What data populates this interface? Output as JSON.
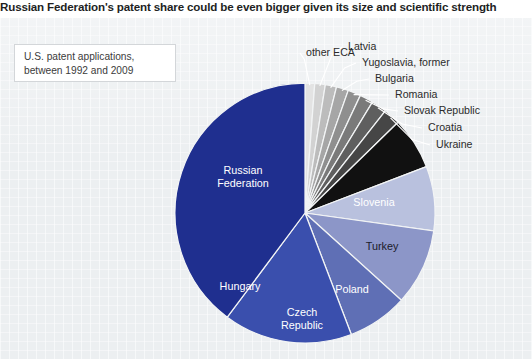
{
  "headline": "Russian Federation's patent share could be even bigger given its size and scientific strength",
  "caption": {
    "line1": "U.S. patent applications,",
    "line2": "between 1992 and 2009"
  },
  "colors": {
    "panel_background": "#eceff1",
    "headline_text": "#221f1f",
    "caption_border": "#d3d6d9",
    "wedge_stroke": "#f2f4f5"
  },
  "chart_data": {
    "type": "pie",
    "title": "Russian Federation's patent share could be even bigger given its size and scientific strength",
    "subtitle": "U.S. patent applications, between 1992 and 2009",
    "legend_position": "labels-on-slices",
    "grid": false,
    "value_unit": "percent share of U.S. patent applications",
    "start_angle_deg": 0,
    "direction": "clockwise",
    "categories": [
      "other ECA",
      "Latvia",
      "Yugoslavia, former",
      "Bulgaria",
      "Romania",
      "Slovak Republic",
      "Croatia",
      "Ukraine",
      "Slovenia",
      "Turkey",
      "Poland",
      "Czech Republic",
      "Hungary",
      "Russian Federation"
    ],
    "values": [
      1.2,
      1.3,
      1.4,
      1.5,
      1.6,
      1.7,
      1.9,
      2.1,
      6.5,
      8.0,
      9.5,
      7.5,
      16.0,
      39.8
    ],
    "colors": [
      "#e3e3e3",
      "#d2d2d2",
      "#bcbcbc",
      "#a6a6a6",
      "#8f8f8f",
      "#7a7a7a",
      "#5f5f5f",
      "#464646",
      "#111111",
      "#b9c1de",
      "#8c96c8",
      "#5f6fb5",
      "#3a4fad",
      "#1f2f8f"
    ],
    "slices": [
      {
        "label": "other ECA",
        "value": 1.2,
        "color": "#e3e3e3",
        "label_placement": "outside"
      },
      {
        "label": "Latvia",
        "value": 1.3,
        "color": "#d2d2d2",
        "label_placement": "outside"
      },
      {
        "label": "Yugoslavia, former",
        "value": 1.4,
        "color": "#bcbcbc",
        "label_placement": "outside"
      },
      {
        "label": "Bulgaria",
        "value": 1.5,
        "color": "#a6a6a6",
        "label_placement": "outside"
      },
      {
        "label": "Romania",
        "value": 1.6,
        "color": "#8f8f8f",
        "label_placement": "outside"
      },
      {
        "label": "Slovak Republic",
        "value": 1.7,
        "color": "#7a7a7a",
        "label_placement": "outside"
      },
      {
        "label": "Croatia",
        "value": 1.9,
        "color": "#5f5f5f",
        "label_placement": "outside"
      },
      {
        "label": "Ukraine",
        "value": 2.1,
        "color": "#464646",
        "label_placement": "outside"
      },
      {
        "label": "Slovenia",
        "value": 6.5,
        "color": "#111111",
        "label_placement": "inside-light"
      },
      {
        "label": "Turkey",
        "value": 8.0,
        "color": "#b9c1de",
        "label_placement": "inside-dark"
      },
      {
        "label": "Poland",
        "value": 9.5,
        "color": "#8c96c8",
        "label_placement": "inside-light"
      },
      {
        "label": "Czech Republic",
        "value": 7.5,
        "color": "#5f6fb5",
        "label_placement": "inside-light"
      },
      {
        "label": "Hungary",
        "value": 16.0,
        "color": "#3a4fad",
        "label_placement": "inside-light"
      },
      {
        "label": "Russian Federation",
        "value": 39.8,
        "color": "#1f2f8f",
        "label_placement": "inside-light"
      }
    ],
    "outside_labels": [
      {
        "text": "other ECA",
        "x": 306,
        "y": 38
      },
      {
        "text": "Latvia",
        "x": 348,
        "y": 32
      },
      {
        "text": "Yugoslavia, former",
        "x": 362,
        "y": 48
      },
      {
        "text": "Bulgaria",
        "x": 375,
        "y": 64
      },
      {
        "text": "Romania",
        "x": 395,
        "y": 80
      },
      {
        "text": "Slovak Republic",
        "x": 404,
        "y": 96
      },
      {
        "text": "Croatia",
        "x": 428,
        "y": 113
      },
      {
        "text": "Ukraine",
        "x": 436,
        "y": 130
      }
    ],
    "inside_labels": [
      {
        "text": "Slovenia",
        "x": 374,
        "y": 188,
        "anchor": "middle",
        "tone": "light"
      },
      {
        "text": "Turkey",
        "x": 382,
        "y": 232,
        "anchor": "middle",
        "tone": "dark"
      },
      {
        "text": "Poland",
        "x": 352,
        "y": 275,
        "anchor": "middle",
        "tone": "light"
      },
      {
        "text": "Czech",
        "x": 302,
        "y": 298,
        "anchor": "middle",
        "tone": "light"
      },
      {
        "text": "Republic",
        "x": 302,
        "y": 311,
        "anchor": "middle",
        "tone": "light"
      },
      {
        "text": "Hungary",
        "x": 240,
        "y": 272,
        "anchor": "middle",
        "tone": "light"
      },
      {
        "text": "Russian",
        "x": 243,
        "y": 156,
        "anchor": "middle",
        "tone": "light"
      },
      {
        "text": "Federation",
        "x": 243,
        "y": 169,
        "anchor": "middle",
        "tone": "light"
      }
    ]
  }
}
